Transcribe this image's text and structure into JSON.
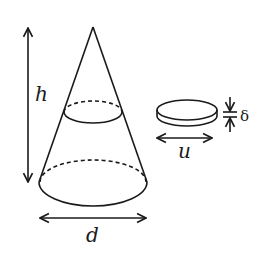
{
  "diagram": {
    "colors": {
      "ink": "#1a1a1a",
      "background": "#ffffff"
    },
    "cone": {
      "height_label": "h",
      "diameter_label": "d"
    },
    "disk": {
      "diameter_label": "u",
      "thickness_label": "δ"
    }
  }
}
